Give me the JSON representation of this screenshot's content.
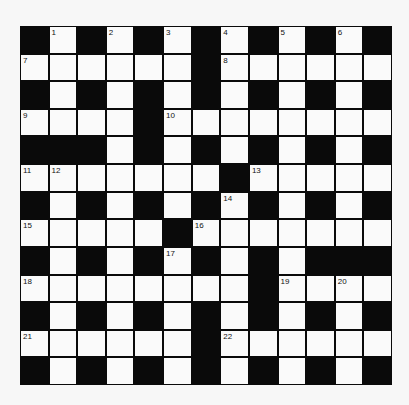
{
  "puzzle": {
    "type": "crossword",
    "size": {
      "rows": 13,
      "cols": 13
    },
    "colors": {
      "block": "#0a0a0a",
      "cell": "#fafafa",
      "background": "#f7f7f7"
    },
    "grid": [
      "#.#.#.#.#.#.#",
      "......#......",
      "#.#.#.#.#.#.#",
      "....#........",
      "###.#.#.#.#.#",
      ".......#.....",
      "#.#.#.#.#.#.#",
      ".....#.......",
      "#.#.#.#.#.###",
      "........#....",
      "#.#.#.#.#.#.#",
      "......#......",
      "#.#.#.#.#.#.#"
    ],
    "numbers": [
      {
        "row": 0,
        "col": 1,
        "n": "1"
      },
      {
        "row": 0,
        "col": 3,
        "n": "2"
      },
      {
        "row": 0,
        "col": 5,
        "n": "3"
      },
      {
        "row": 0,
        "col": 7,
        "n": "4"
      },
      {
        "row": 0,
        "col": 9,
        "n": "5"
      },
      {
        "row": 0,
        "col": 11,
        "n": "6"
      },
      {
        "row": 1,
        "col": 0,
        "n": "7"
      },
      {
        "row": 1,
        "col": 7,
        "n": "8"
      },
      {
        "row": 3,
        "col": 0,
        "n": "9"
      },
      {
        "row": 3,
        "col": 5,
        "n": "10"
      },
      {
        "row": 5,
        "col": 0,
        "n": "11"
      },
      {
        "row": 5,
        "col": 1,
        "n": "12"
      },
      {
        "row": 5,
        "col": 8,
        "n": "13"
      },
      {
        "row": 6,
        "col": 7,
        "n": "14"
      },
      {
        "row": 7,
        "col": 0,
        "n": "15"
      },
      {
        "row": 7,
        "col": 6,
        "n": "16"
      },
      {
        "row": 8,
        "col": 5,
        "n": "17"
      },
      {
        "row": 9,
        "col": 0,
        "n": "18"
      },
      {
        "row": 9,
        "col": 9,
        "n": "19"
      },
      {
        "row": 9,
        "col": 11,
        "n": "20"
      },
      {
        "row": 11,
        "col": 0,
        "n": "21"
      },
      {
        "row": 11,
        "col": 7,
        "n": "22"
      }
    ]
  }
}
